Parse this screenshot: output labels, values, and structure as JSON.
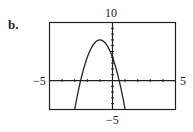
{
  "panel_label": "b.",
  "axis_labels": {
    "y_max": "10",
    "y_min": "−5",
    "x_min": "−5",
    "x_max": "5"
  },
  "chart_data": {
    "type": "line",
    "title": "",
    "xlabel": "",
    "ylabel": "",
    "xlim": [
      -5,
      5
    ],
    "ylim": [
      -5,
      10
    ],
    "grid": false,
    "x_tick_step": 1,
    "y_tick_step": 1,
    "series": [
      {
        "name": "parabola (approx. y = -3x^2 - 6x + 4)",
        "x": [
          -3.0,
          -2.5,
          -2.0,
          -1.5,
          -1.0,
          -0.5,
          0.0,
          0.5,
          1.0
        ],
        "values": [
          -5,
          -0.75,
          4,
          6.25,
          7,
          6.25,
          4,
          -0.75,
          -5
        ]
      }
    ],
    "annotations": [
      "vertex ≈ (-1, 7)",
      "x-intercepts ≈ -2.5 and 0.5",
      "y-intercept ≈ 4"
    ]
  }
}
